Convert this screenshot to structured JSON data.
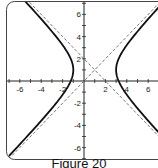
{
  "caption": "Figure 20",
  "chart_data": {
    "type": "line",
    "title": "",
    "xlabel": "",
    "ylabel": "",
    "xlim": [
      -7.3,
      7.0
    ],
    "ylim": [
      -7.1,
      7.3
    ],
    "grid": false,
    "legend": null,
    "x_ticks": [
      -6,
      -4,
      -2,
      2,
      4,
      6
    ],
    "y_ticks": [
      6,
      4,
      2,
      -2,
      -4,
      -6
    ],
    "x_tick_labels": [
      "-6",
      "-4",
      "-2",
      "2",
      "4",
      "6"
    ],
    "y_tick_labels": [
      "6",
      "4",
      "2",
      "-2",
      "-4",
      "-6"
    ],
    "series": [
      {
        "name": "hyperbola",
        "equation": "(x-1)^2/4 - (y-1)^2/4 = 1",
        "center": [
          1,
          1
        ],
        "a": 2,
        "b": 2,
        "style": "solid",
        "color": "#111111"
      },
      {
        "name": "asymptote 1",
        "equation": "y = x",
        "style": "dashed",
        "color": "#555555"
      },
      {
        "name": "asymptote 2",
        "equation": "y = -x + 2",
        "style": "dashed",
        "color": "#555555"
      }
    ]
  },
  "frame": {
    "color": "#444444"
  },
  "axis_color": "#222222",
  "curve_color": "#111111",
  "asymptote_color": "#666666"
}
